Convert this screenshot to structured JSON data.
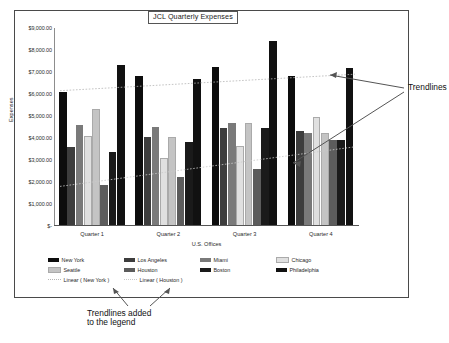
{
  "chart_data": {
    "type": "bar",
    "title": "JCL Quarterly Expenses",
    "xlabel": "U.S. Offices",
    "ylabel": "Expenses",
    "categories": [
      "Quarter 1",
      "Quarter 2",
      "Quarter 3",
      "Quarter 4"
    ],
    "ylim": [
      0,
      9000
    ],
    "ytick_labels": [
      "$9,000.00",
      "$8,000.00",
      "$7,000.00",
      "$6,000.00",
      "$5,000.00",
      "$4,000.00",
      "$3,000.00",
      "$2,000.00",
      "$1,000.00",
      "$-"
    ],
    "ytick_values": [
      9000,
      8000,
      7000,
      6000,
      5000,
      4000,
      3000,
      2000,
      1000,
      0
    ],
    "grid": false,
    "legend_position": "bottom",
    "series": [
      {
        "name": "New York",
        "color": "#0d0d0d",
        "values": [
          6100,
          6800,
          7250,
          6800
        ]
      },
      {
        "name": "Los Angeles",
        "color": "#3d3d3d",
        "values": [
          3600,
          4050,
          4450,
          4300
        ]
      },
      {
        "name": "Miami",
        "color": "#7a7a7a",
        "values": [
          4600,
          4500,
          4700,
          4250
        ]
      },
      {
        "name": "Chicago",
        "color": "#e0e0e0",
        "values": [
          4100,
          3100,
          3650,
          4950
        ]
      },
      {
        "name": "Seattle",
        "color": "#c4c4c4",
        "values": [
          5300,
          4050,
          4700,
          4250
        ]
      },
      {
        "name": "Houston",
        "color": "#5c5c5c",
        "values": [
          1850,
          2250,
          2600,
          3900
        ]
      },
      {
        "name": "Boston",
        "color": "#1a1a1a",
        "values": [
          3350,
          3800,
          4450,
          3900
        ]
      },
      {
        "name": "Philadelphia",
        "color": "#111111",
        "values": [
          7300,
          6700,
          8400,
          7200
        ]
      }
    ],
    "trendlines": [
      {
        "name": "Linear (New York)",
        "color": "#b5b5b5",
        "style": "dotted",
        "start_value": 6150,
        "end_value": 6900
      },
      {
        "name": "Linear (Houston)",
        "color": "#c9c9c9",
        "style": "dotted",
        "start_value": 1800,
        "end_value": 3600
      }
    ]
  },
  "legend": {
    "series_labels": [
      "New York",
      "Los Angeles",
      "Miami",
      "Chicago",
      "Seattle",
      "Houston",
      "Boston",
      "Philadelphia"
    ],
    "trend_labels": [
      "Linear ( New York )",
      "Linear ( Houston )"
    ]
  },
  "annotations": {
    "right_label": "Trendlines",
    "bottom_line1": "Trendlines added",
    "bottom_line2": "to the legend"
  }
}
